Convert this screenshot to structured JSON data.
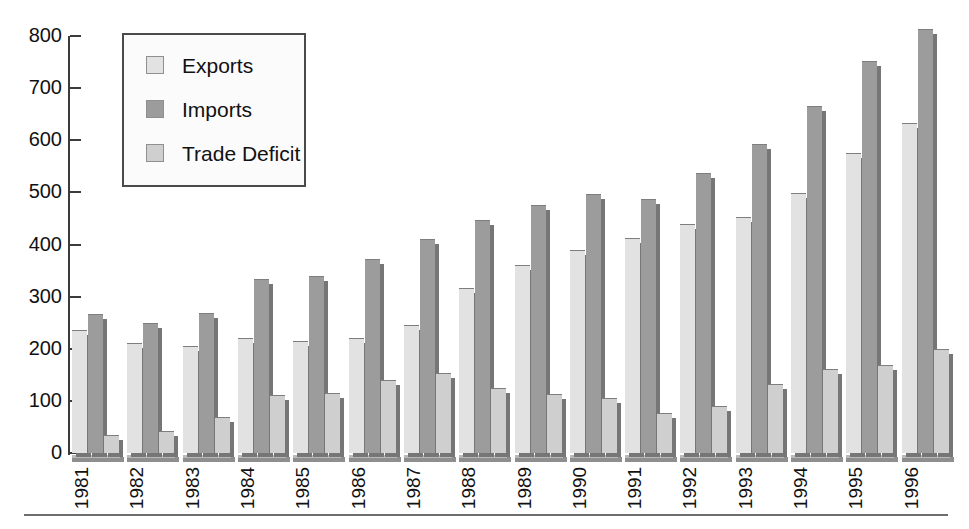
{
  "chart_data": {
    "type": "bar",
    "title": "",
    "xlabel": "",
    "ylabel": "",
    "ylim": [
      0,
      800
    ],
    "yticks": [
      0,
      100,
      200,
      300,
      400,
      500,
      600,
      700,
      800
    ],
    "grid": false,
    "legend_position": "top-left",
    "categories": [
      "1981",
      "1982",
      "1983",
      "1984",
      "1985",
      "1986",
      "1987",
      "1988",
      "1989",
      "1990",
      "1991",
      "1992",
      "1993",
      "1994",
      "1995",
      "1996"
    ],
    "series": [
      {
        "name": "Exports",
        "color": "#e2e2e2",
        "values": [
          235,
          210,
          203,
          218,
          213,
          218,
          243,
          315,
          358,
          387,
          410,
          438,
          450,
          496,
          573,
          632
        ]
      },
      {
        "name": "Imports",
        "color": "#9c9c9c",
        "values": [
          265,
          248,
          267,
          332,
          337,
          371,
          409,
          446,
          473,
          495,
          485,
          536,
          590,
          664,
          750,
          812
        ]
      },
      {
        "name": "Trade Deficit",
        "color": "#cfcfcf",
        "values": [
          33,
          40,
          68,
          110,
          114,
          139,
          152,
          123,
          112,
          104,
          75,
          88,
          130,
          159,
          167,
          198
        ]
      }
    ]
  },
  "legend": {
    "items": [
      {
        "label": "Exports",
        "swatch": "#e2e2e2"
      },
      {
        "label": "Imports",
        "swatch": "#9c9c9c"
      },
      {
        "label": "Trade Deficit",
        "swatch": "#cfcfcf"
      }
    ]
  },
  "axis": {
    "y_tick_labels": [
      "800",
      "700",
      "600",
      "500",
      "400",
      "300",
      "200",
      "100",
      "0"
    ]
  }
}
